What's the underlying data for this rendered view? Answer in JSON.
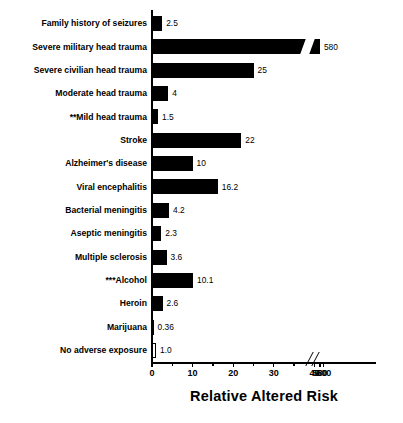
{
  "chart_data": {
    "type": "bar",
    "orientation": "horizontal",
    "title": "",
    "xlabel": "Relative Altered Risk",
    "ylabel": "",
    "grid": false,
    "legend": null,
    "axis_break": {
      "from": 45,
      "to": 570,
      "note": "x-axis is broken between 40 and 580"
    },
    "xticks": [
      0,
      10,
      20,
      30,
      40,
      580,
      600
    ],
    "xtick_labels": [
      "0",
      "10",
      "20",
      "30",
      "40",
      "580",
      "600"
    ],
    "xlim": [
      0,
      600
    ],
    "categories": [
      "Family history of seizures",
      "Severe military head trauma",
      "Severe civilian head trauma",
      "Moderate head trauma",
      "**Mild head trauma",
      "Stroke",
      "Alzheimer's disease",
      "Viral encephalitis",
      "Bacterial meningitis",
      "Aseptic meningitis",
      "Multiple sclerosis",
      "***Alcohol",
      "Heroin",
      "Marijuana",
      "No adverse exposure"
    ],
    "values": [
      2.5,
      580,
      25,
      4,
      1.5,
      22,
      10,
      16.2,
      4.2,
      2.3,
      3.6,
      10.1,
      2.6,
      0.36,
      1.0
    ],
    "value_labels": [
      "2.5",
      "580",
      "25",
      "4",
      "1.5",
      "22",
      "10",
      "16.2",
      "4.2",
      "2.3",
      "3.6",
      "10.1",
      "2.6",
      "0.36",
      "1.0"
    ],
    "bar_styles": [
      "filled",
      "filled-broken",
      "filled",
      "filled",
      "filled",
      "filled",
      "filled",
      "filled",
      "filled",
      "filled",
      "filled",
      "filled",
      "filled",
      "filled",
      "hollow"
    ],
    "colors": {
      "bar_fill": "#000000",
      "bar_outline": "#000000",
      "background": "#ffffff",
      "text": "#000000"
    }
  }
}
